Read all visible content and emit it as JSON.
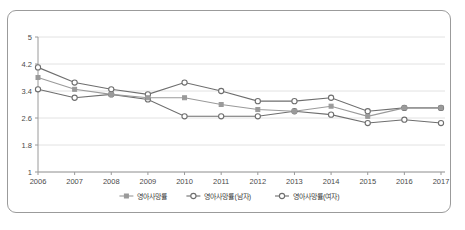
{
  "chart_data": {
    "type": "line",
    "title": "",
    "subtitle": "",
    "xlabel": "",
    "ylabel": "",
    "categories": [
      "2006",
      "2007",
      "2008",
      "2009",
      "2010",
      "2011",
      "2012",
      "2013",
      "2014",
      "2015",
      "2016",
      "2017"
    ],
    "ylim": [
      1,
      5
    ],
    "yticks": [
      "1",
      "1.8",
      "2.6",
      "3.4",
      "4.2",
      "5"
    ],
    "ytick_values": [
      1,
      1.8,
      2.6,
      3.4,
      4.2,
      5
    ],
    "grid": true,
    "legend_position": "bottom",
    "series": [
      {
        "name": "영아사망률",
        "color": "#9a9a9a",
        "marker": "square",
        "values": [
          3.8,
          3.45,
          3.3,
          3.2,
          3.2,
          3.0,
          2.85,
          2.8,
          2.95,
          2.65,
          2.9,
          2.9
        ]
      },
      {
        "name": "영아사망률(남자)",
        "color": "#6e6e6e",
        "marker": "circle",
        "values": [
          4.1,
          3.65,
          3.45,
          3.3,
          3.65,
          3.4,
          3.1,
          3.1,
          3.2,
          2.8,
          2.9,
          2.9
        ]
      },
      {
        "name": "영아사망률(여자)",
        "color": "#6e6e6e",
        "marker": "circle",
        "values": [
          3.45,
          3.2,
          3.3,
          3.15,
          2.65,
          2.65,
          2.65,
          2.8,
          2.7,
          2.45,
          2.55,
          2.45
        ]
      }
    ]
  },
  "legend": {
    "items": [
      {
        "label": "영아사망률",
        "marker": "square",
        "color": "#9a9a9a"
      },
      {
        "label": "영아사망률(남자)",
        "marker": "circle",
        "color": "#6e6e6e"
      },
      {
        "label": "영아사망률(여자)",
        "marker": "circle",
        "color": "#6e6e6e"
      }
    ]
  },
  "colors": {
    "frame_border": "#9b9b9b",
    "gridline": "#e2e2e2",
    "axis": "#9a9a9a",
    "background": "#ffffff"
  }
}
